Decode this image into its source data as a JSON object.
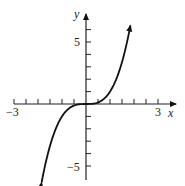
{
  "chart_data": {
    "type": "line",
    "title": "",
    "function": "y = x^3",
    "xlabel": "x",
    "ylabel": "y",
    "xlim": [
      -3,
      3
    ],
    "ylim": [
      -6,
      6
    ],
    "x_tick_step": 0.5,
    "y_tick_step": 1,
    "x_tick_labels": [
      "-3",
      "3"
    ],
    "y_tick_labels": [
      "5",
      "-5"
    ],
    "x": [
      -1.85,
      -1.5,
      -1,
      -0.5,
      0,
      0.5,
      1,
      1.5,
      1.85
    ],
    "y": [
      -6.33,
      -3.375,
      -1,
      -0.125,
      0,
      0.125,
      1,
      3.375,
      6.33
    ],
    "arrows_on_curve_ends": true,
    "grid": false,
    "line_color": "#111111"
  },
  "labels": {
    "x_axis": "x",
    "y_axis": "y",
    "x_min": "−3",
    "x_max": "3",
    "y_max": "5",
    "y_min": "−5"
  }
}
